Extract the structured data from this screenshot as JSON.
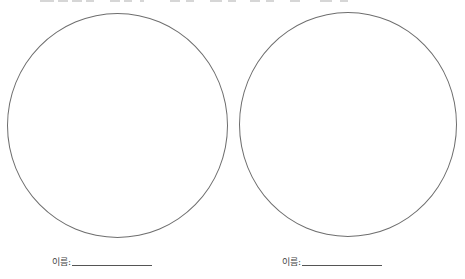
{
  "worksheet": {
    "top_instruction_clipped": true,
    "shapes": [
      {
        "type": "circle",
        "position": "left"
      },
      {
        "type": "circle",
        "position": "right"
      }
    ],
    "name_fields": [
      {
        "label": "이름:",
        "value": ""
      },
      {
        "label": "이름:",
        "value": ""
      }
    ]
  },
  "colors": {
    "circle_stroke": "#6e6e6e",
    "text": "#444444",
    "background": "#ffffff"
  }
}
